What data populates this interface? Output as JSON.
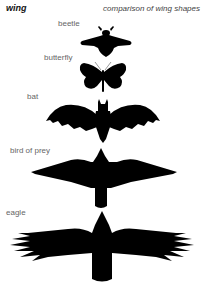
{
  "header": {
    "title": "wing",
    "subtitle": "comparison of wing shapes"
  },
  "silhouettes": [
    {
      "label": "beetle",
      "icon": "beetle-icon"
    },
    {
      "label": "butterfly",
      "icon": "butterfly-icon"
    },
    {
      "label": "bat",
      "icon": "bat-icon"
    },
    {
      "label": "bird of prey",
      "icon": "bird-of-prey-icon"
    },
    {
      "label": "eagle",
      "icon": "eagle-icon"
    }
  ],
  "colors": {
    "silhouette": "#000000",
    "label": "#666666",
    "background": "#ffffff"
  }
}
